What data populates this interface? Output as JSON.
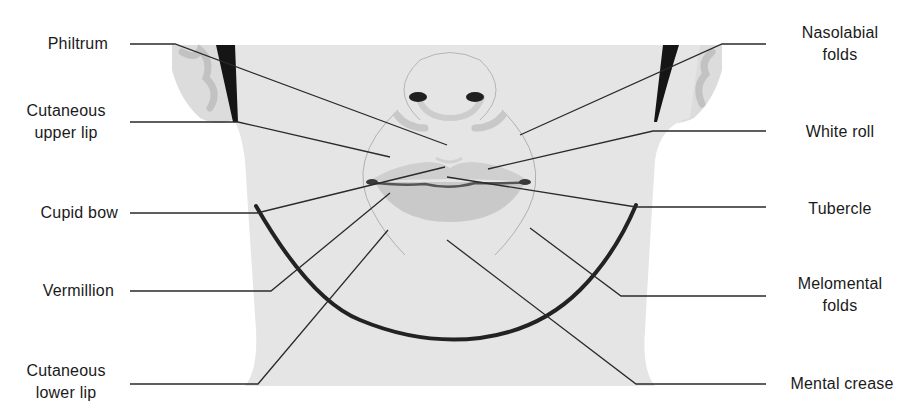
{
  "diagram": {
    "colors": {
      "skin": "#e5e5e5",
      "ear_shade": "#c4c4c4",
      "hair": "#151515",
      "lip": "#c9c9c9",
      "lip_line": "#555555",
      "jaw_line": "#222222",
      "leader": "#2a2a2a",
      "text": "#1a1a1a"
    },
    "labels_left": [
      {
        "id": "philtrum",
        "line1": "Philtrum",
        "line2": ""
      },
      {
        "id": "cutaneous-upper-lip",
        "line1": "Cutaneous",
        "line2": "upper lip"
      },
      {
        "id": "cupid-bow",
        "line1": "Cupid bow",
        "line2": ""
      },
      {
        "id": "vermillion",
        "line1": "Vermillion",
        "line2": ""
      },
      {
        "id": "cutaneous-lower-lip",
        "line1": "Cutaneous",
        "line2": "lower lip"
      }
    ],
    "labels_right": [
      {
        "id": "nasolabial-folds",
        "line1": "Nasolabial",
        "line2": "folds"
      },
      {
        "id": "white-roll",
        "line1": "White roll",
        "line2": ""
      },
      {
        "id": "tubercle",
        "line1": "Tubercle",
        "line2": ""
      },
      {
        "id": "melomental-folds",
        "line1": "Melomental",
        "line2": "folds"
      },
      {
        "id": "mental-crease",
        "line1": "Mental crease",
        "line2": ""
      }
    ]
  }
}
